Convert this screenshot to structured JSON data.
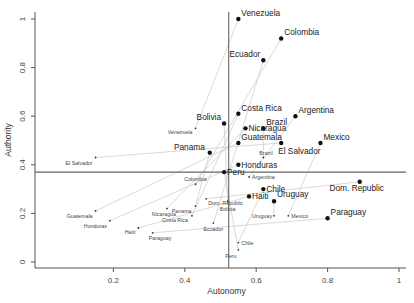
{
  "chart_data": {
    "type": "scatter",
    "title": "",
    "xlabel": "Autonomy",
    "ylabel": "Authority",
    "xlim": [
      0,
      1
    ],
    "ylim": [
      0,
      1
    ],
    "x_ticks": [
      0.2,
      0.4,
      0.6,
      0.8,
      1
    ],
    "x_tick_labels": [
      "0.2",
      "0.4",
      "0.6",
      "0.8",
      "1"
    ],
    "y_ticks": [
      0,
      0.2,
      0.4,
      0.6,
      0.8,
      1
    ],
    "y_tick_labels": [
      "0",
      "0.2",
      "0.4",
      "0.6",
      "0.8",
      "1"
    ],
    "grid": false,
    "reference_lines": {
      "vertical_x": 0.523,
      "horizontal_y": 0.37
    },
    "series": [
      {
        "name": "Large (labeled, bold)",
        "marker": "filled-circle",
        "points": [
          {
            "label": "Venezuela",
            "x": 0.55,
            "y": 1.0
          },
          {
            "label": "Colombia",
            "x": 0.67,
            "y": 0.92
          },
          {
            "label": "Ecuador",
            "x": 0.62,
            "y": 0.83
          },
          {
            "label": "Costa Rica",
            "x": 0.55,
            "y": 0.61
          },
          {
            "label": "Bolivia",
            "x": 0.51,
            "y": 0.57
          },
          {
            "label": "Argentina",
            "x": 0.71,
            "y": 0.6
          },
          {
            "label": "Brazil",
            "x": 0.62,
            "y": 0.55
          },
          {
            "label": "Nicaragua",
            "x": 0.57,
            "y": 0.55
          },
          {
            "label": "Guatemala",
            "x": 0.55,
            "y": 0.49
          },
          {
            "label": "Panama",
            "x": 0.47,
            "y": 0.45
          },
          {
            "label": "El Salvador",
            "x": 0.67,
            "y": 0.49
          },
          {
            "label": "Mexico",
            "x": 0.78,
            "y": 0.49
          },
          {
            "label": "Honduras",
            "x": 0.55,
            "y": 0.4
          },
          {
            "label": "Peru",
            "x": 0.51,
            "y": 0.37
          },
          {
            "label": "Chile",
            "x": 0.62,
            "y": 0.3
          },
          {
            "label": "Haiti",
            "x": 0.58,
            "y": 0.27
          },
          {
            "label": "Uruguay",
            "x": 0.65,
            "y": 0.25
          },
          {
            "label": "Dom. Republic",
            "x": 0.89,
            "y": 0.33
          },
          {
            "label": "Paraguay",
            "x": 0.8,
            "y": 0.18
          }
        ]
      },
      {
        "name": "Small (labeled, small text)",
        "marker": "small-dot",
        "points": [
          {
            "label": "El Salvador",
            "x": 0.15,
            "y": 0.43
          },
          {
            "label": "Venezuela",
            "x": 0.43,
            "y": 0.55
          },
          {
            "label": "Guatemala",
            "x": 0.15,
            "y": 0.21
          },
          {
            "label": "Honduras",
            "x": 0.19,
            "y": 0.17
          },
          {
            "label": "Haiti",
            "x": 0.27,
            "y": 0.14
          },
          {
            "label": "Paraguay",
            "x": 0.31,
            "y": 0.12
          },
          {
            "label": "Nicaragua",
            "x": 0.35,
            "y": 0.22
          },
          {
            "label": "Panama",
            "x": 0.43,
            "y": 0.23
          },
          {
            "label": "Costa Rica",
            "x": 0.42,
            "y": 0.19
          },
          {
            "label": "Ecuador",
            "x": 0.48,
            "y": 0.16
          },
          {
            "label": "Colombia",
            "x": 0.43,
            "y": 0.32
          },
          {
            "label": "Dom. Republic",
            "x": 0.46,
            "y": 0.26
          },
          {
            "label": "Bolivia",
            "x": 0.52,
            "y": 0.25
          },
          {
            "label": "Argentina",
            "x": 0.58,
            "y": 0.35
          },
          {
            "label": "Brazil",
            "x": 0.62,
            "y": 0.43
          },
          {
            "label": "Uruguay",
            "x": 0.65,
            "y": 0.19
          },
          {
            "label": "Mexico",
            "x": 0.69,
            "y": 0.19
          },
          {
            "label": "Chile",
            "x": 0.55,
            "y": 0.08
          },
          {
            "label": "Peru",
            "x": 0.55,
            "y": 0.05
          }
        ]
      }
    ],
    "connectors": "thin gray lines join each country's small point to its large point"
  }
}
